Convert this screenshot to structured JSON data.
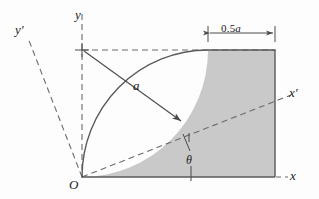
{
  "figure": {
    "background": "#fdfdfd",
    "shade_fill": "#c9c9c9",
    "line_color": "#4a4a4a",
    "dash_color": "#6b6b6b",
    "text_color": "#1a1a1a"
  },
  "labels": {
    "y_axis": "y",
    "y_prime_axis": "y′",
    "x_axis": "x",
    "x_prime_axis": "x′",
    "origin": "O",
    "radius": "a",
    "angle": "θ",
    "dimension": "0.5a",
    "dimension_value": "0.5",
    "dimension_unit": "a"
  },
  "geometry": {
    "origin": [
      82,
      177
    ],
    "arc_center": [
      82,
      50
    ],
    "arc_radius": 126,
    "arc_start": [
      208,
      50
    ],
    "arc_end": [
      82,
      177
    ],
    "region_right_edge_x": 275,
    "region_top_y": 50,
    "region_bottom_y": 177,
    "dimension_line_y": 33,
    "dimension_from_x": 208,
    "dimension_to_x": 275,
    "radius_arrow_from": [
      82,
      50
    ],
    "radius_arrow_to": [
      182,
      122
    ],
    "x_prime_end": [
      291,
      95
    ],
    "y_prime_end": [
      28,
      38
    ],
    "angle_vertex": [
      189,
      139
    ],
    "theta_leader_bottom": [
      189,
      180
    ]
  }
}
